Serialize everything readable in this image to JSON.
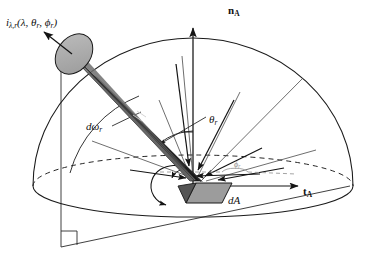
{
  "figure": {
    "type": "technical-diagram",
    "domain": "radiometry",
    "background_color": "#ffffff",
    "line_color": "#1a1a1a"
  },
  "labels": {
    "radiance": {
      "symbol": "i",
      "sub": "λ,r",
      "args": "(λ, θ",
      "args_sub1": "r",
      "args_mid": ", ϕ",
      "args_sub2": "r",
      "args_close": ")",
      "full_text": "iλ,r (λ, θr, ϕr)",
      "meaning": "spectral reflected radiance"
    },
    "normal": {
      "symbol": "n",
      "sub": "A",
      "full_text": "nA",
      "meaning": "surface normal vector"
    },
    "tangent": {
      "symbol": "t",
      "sub": "A",
      "full_text": "tA",
      "meaning": "surface tangent vector"
    },
    "area": {
      "symbol": "dA",
      "full_text": "dA",
      "meaning": "differential surface area element"
    },
    "theta": {
      "symbol": "θ",
      "sub": "r",
      "full_text": "θr",
      "meaning": "reflected zenith angle"
    },
    "solid_angle": {
      "symbol": "dω",
      "sub": "r",
      "full_text": "dωr",
      "meaning": "differential solid angle of reflection"
    },
    "phi": {
      "symbol": "ϕ",
      "sub": "r",
      "full_text": "ϕr",
      "meaning": "reflected azimuth angle"
    }
  },
  "colors": {
    "cylinder_cap": "#a9a9a9",
    "cylinder_body_light": "#8d8d8d",
    "cylinder_body_dark": "#3a3a3a",
    "cylinder_body_darkest": "#1e1e1e",
    "area_patch": "#9a9a9a",
    "area_patch_dark": "#5a5a5a",
    "stroke": "#1a1a1a",
    "phi_arc": "#9a9a9a"
  },
  "geometry": {
    "hemisphere_center": [
      193,
      186
    ],
    "hemisphere_radius_x": 160,
    "hemisphere_radius_y": 148,
    "ellipse_ry": 30,
    "normal_tip": [
      193,
      30
    ],
    "tangent_tip": [
      300,
      186
    ],
    "cylinder_axis_angle_deg": 38,
    "zenith_angle_deg": 38
  },
  "rays": {
    "count": 7,
    "description": "straight rays from hemisphere surface converging on dA"
  }
}
